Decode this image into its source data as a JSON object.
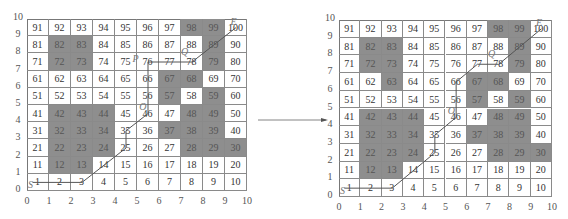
{
  "left_panel": {
    "grid": {
      "x": 27,
      "y": 19,
      "w": 220,
      "h": 172
    },
    "obstacles": [
      82,
      83,
      72,
      73,
      98,
      99,
      89,
      79,
      67,
      68,
      57,
      59,
      48,
      49,
      42,
      43,
      44,
      32,
      33,
      34,
      22,
      23,
      24,
      12,
      13,
      37,
      38,
      39,
      28,
      29,
      30
    ],
    "path_cells": [
      1,
      2,
      3,
      25,
      35,
      46,
      76,
      78,
      100
    ],
    "path_points": [
      [
        0.25,
        0.5
      ],
      [
        2.5,
        0.5
      ],
      [
        4.5,
        2.5
      ],
      [
        4.5,
        3.5
      ],
      [
        5.5,
        4.5
      ],
      [
        5.5,
        7.5
      ],
      [
        7.5,
        7.5
      ],
      [
        9.5,
        9.5
      ]
    ],
    "labels": {
      "S": "S",
      "O": "O",
      "P": "P",
      "Q": "Q",
      "E": "E"
    }
  },
  "right_panel": {
    "grid": {
      "x": 339,
      "y": 20,
      "w": 213,
      "h": 177
    },
    "obstacles": [
      82,
      83,
      72,
      73,
      63,
      98,
      99,
      89,
      79,
      67,
      68,
      57,
      59,
      48,
      49,
      42,
      43,
      44,
      32,
      33,
      34,
      22,
      23,
      24,
      12,
      13,
      37,
      38,
      39,
      28,
      29,
      30
    ],
    "path_points": [
      [
        0.25,
        0.5
      ],
      [
        2.5,
        0.5
      ],
      [
        4.5,
        2.5
      ],
      [
        4.5,
        3.5
      ],
      [
        5.5,
        4.5
      ],
      [
        5.5,
        6.5
      ],
      [
        6.5,
        7.5
      ],
      [
        7.5,
        7.5
      ],
      [
        9.5,
        9.5
      ]
    ],
    "labels": {
      "S": "S",
      "O": "O",
      "Q": "Q",
      "E": "E"
    }
  },
  "axis_ticks": [
    "0",
    "1",
    "2",
    "3",
    "4",
    "5",
    "6",
    "7",
    "8",
    "9",
    "10"
  ],
  "colors": {
    "obstacle": "#8e8e8e",
    "free": "#ffffff",
    "path": "#555555",
    "grid": "#8a8a8a"
  },
  "arrow": {
    "from": [
      258,
      120
    ],
    "to": [
      328,
      120
    ]
  }
}
